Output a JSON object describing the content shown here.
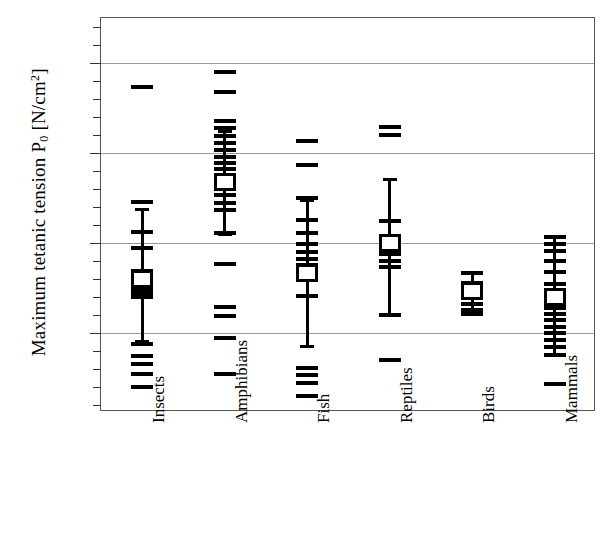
{
  "chart_data": {
    "type": "scatter",
    "title": "",
    "xlabel": "",
    "ylabel": "Maximum tetanic tension P₀  [N/cm²]",
    "ylabel_main": "Maximum tetanic tension P",
    "ylabel_sub": "0",
    "ylabel_units_open": "  [N/cm",
    "ylabel_sup": "2",
    "ylabel_units_close": "]",
    "ylim": [
      1.2,
      45.0
    ],
    "yticks": [
      10,
      20,
      30,
      40
    ],
    "ytick_labels": [
      "10",
      "20",
      "30",
      "40"
    ],
    "minor_tick_step": 2,
    "grid": true,
    "legend": "none",
    "categories": [
      "Insects",
      "Amphibians",
      "Fish",
      "Reptiles",
      "Birds",
      "Mammals"
    ],
    "series": [
      {
        "name": "Insects",
        "mean": 16.0,
        "error_low": 9.2,
        "error_high": 23.9,
        "points": [
          37.5,
          24.8,
          21.4,
          19.6,
          17.1,
          16.6,
          15.6,
          15.0,
          14.6,
          14.2,
          9.0,
          7.6,
          6.8,
          5.6,
          4.2
        ]
      },
      {
        "name": "Amphibians",
        "mean": 26.8,
        "error_low": 21.1,
        "error_high": 32.6,
        "points": [
          39.2,
          37.0,
          33.8,
          33.0,
          32.1,
          31.3,
          30.6,
          29.8,
          29.1,
          28.4,
          27.7,
          27.0,
          26.3,
          25.5,
          24.7,
          23.9,
          21.3,
          17.9,
          13.1,
          12.1,
          9.6,
          5.6
        ]
      },
      {
        "name": "Fish",
        "mean": 16.6,
        "error_low": 8.6,
        "error_high": 24.9,
        "points": [
          31.6,
          28.9,
          25.2,
          22.8,
          21.3,
          20.1,
          19.2,
          18.4,
          17.8,
          17.2,
          16.4,
          14.3,
          6.3,
          5.5,
          4.6,
          3.2
        ]
      },
      {
        "name": "Reptiles",
        "mean": 20.0,
        "error_low": 12.1,
        "error_high": 27.2,
        "points": [
          33.1,
          32.2,
          22.6,
          19.0,
          18.2,
          17.5,
          12.2,
          7.2
        ]
      },
      {
        "name": "Birds",
        "mean": 14.6,
        "error_low": 12.3,
        "error_high": 16.9,
        "points": [
          16.9,
          15.8,
          13.4,
          12.8,
          12.3
        ]
      },
      {
        "name": "Mammals",
        "mean": 14.0,
        "error_low": 7.6,
        "error_high": 20.9,
        "points": [
          20.9,
          20.1,
          19.3,
          18.2,
          17.0,
          15.6,
          13.0,
          12.3,
          11.6,
          10.9,
          10.2,
          9.4,
          8.6,
          7.8,
          4.5
        ]
      }
    ]
  },
  "colors": {
    "marker": "#000000",
    "grid": "#9a9a9a",
    "frame": "#555555",
    "background": "#ffffff"
  }
}
